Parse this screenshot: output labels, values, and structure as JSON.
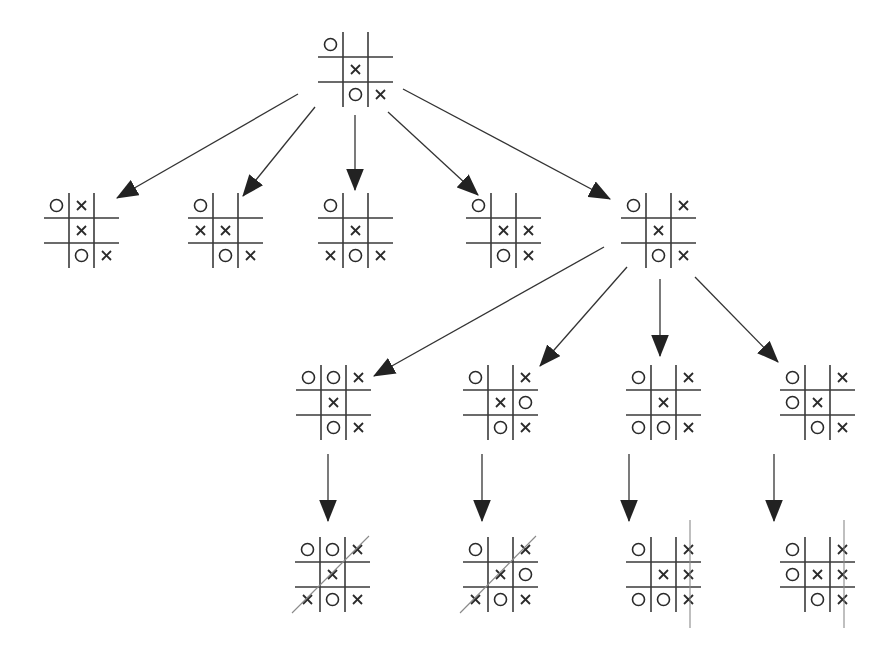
{
  "diagram": {
    "type": "game-tree",
    "colors": {
      "line": "#333333",
      "mark": "#2a2a2a",
      "win_line": "#8a8a8a",
      "background": "#ffffff"
    },
    "cell_size": 25,
    "nodes": [
      {
        "id": "root",
        "x": 318,
        "y": 32,
        "board": [
          "O",
          "",
          "",
          "",
          "X",
          "",
          "",
          "O",
          "X"
        ]
      },
      {
        "id": "L1-1",
        "x": 44,
        "y": 193,
        "board": [
          "O",
          "X",
          "",
          "",
          "X",
          "",
          "",
          "O",
          "X"
        ]
      },
      {
        "id": "L1-2",
        "x": 188,
        "y": 193,
        "board": [
          "O",
          "",
          "",
          "X",
          "X",
          "",
          "",
          "O",
          "X"
        ]
      },
      {
        "id": "L1-3",
        "x": 318,
        "y": 193,
        "board": [
          "O",
          "",
          "",
          "",
          "X",
          "",
          "X",
          "O",
          "X"
        ]
      },
      {
        "id": "L1-4",
        "x": 466,
        "y": 193,
        "board": [
          "O",
          "",
          "",
          "",
          "X",
          "X",
          "",
          "O",
          "X"
        ]
      },
      {
        "id": "L1-5",
        "x": 621,
        "y": 193,
        "board": [
          "O",
          "",
          "X",
          "",
          "X",
          "",
          "",
          "O",
          "X"
        ]
      },
      {
        "id": "L2-1",
        "x": 296,
        "y": 365,
        "board": [
          "O",
          "O",
          "X",
          "",
          "X",
          "",
          "",
          "O",
          "X"
        ]
      },
      {
        "id": "L2-2",
        "x": 463,
        "y": 365,
        "board": [
          "O",
          "",
          "X",
          "",
          "X",
          "O",
          "",
          "O",
          "X"
        ]
      },
      {
        "id": "L2-3",
        "x": 626,
        "y": 365,
        "board": [
          "O",
          "",
          "X",
          "",
          "X",
          "",
          "O",
          "O",
          "X"
        ]
      },
      {
        "id": "L2-4",
        "x": 780,
        "y": 365,
        "board": [
          "O",
          "",
          "X",
          "O",
          "X",
          "",
          "",
          "O",
          "X"
        ]
      },
      {
        "id": "L3-1",
        "x": 295,
        "y": 537,
        "board": [
          "O",
          "O",
          "X",
          "",
          "X",
          "",
          "X",
          "O",
          "X"
        ],
        "win": {
          "type": "anti-diagonal",
          "x1": 292,
          "y1": 613,
          "x2": 369,
          "y2": 536
        }
      },
      {
        "id": "L3-2",
        "x": 463,
        "y": 537,
        "board": [
          "O",
          "",
          "X",
          "",
          "X",
          "O",
          "X",
          "O",
          "X"
        ],
        "win": {
          "type": "anti-diagonal",
          "x1": 460,
          "y1": 613,
          "x2": 536,
          "y2": 536
        }
      },
      {
        "id": "L3-3",
        "x": 626,
        "y": 537,
        "board": [
          "O",
          "",
          "X",
          "",
          "X",
          "X",
          "O",
          "O",
          "X"
        ],
        "win": {
          "type": "column",
          "x1": 690,
          "y1": 520,
          "x2": 690,
          "y2": 628
        }
      },
      {
        "id": "L3-4",
        "x": 780,
        "y": 537,
        "board": [
          "O",
          "",
          "X",
          "O",
          "X",
          "X",
          "",
          "O",
          "X"
        ],
        "win": {
          "type": "column",
          "x1": 844,
          "y1": 520,
          "x2": 844,
          "y2": 628
        }
      }
    ],
    "edges": [
      {
        "from": "root",
        "to": "L1-1",
        "x1": 298,
        "y1": 94,
        "x2": 117,
        "y2": 198
      },
      {
        "from": "root",
        "to": "L1-2",
        "x1": 315,
        "y1": 107,
        "x2": 243,
        "y2": 196
      },
      {
        "from": "root",
        "to": "L1-3",
        "x1": 355,
        "y1": 115,
        "x2": 355,
        "y2": 190
      },
      {
        "from": "root",
        "to": "L1-4",
        "x1": 388,
        "y1": 112,
        "x2": 478,
        "y2": 195
      },
      {
        "from": "root",
        "to": "L1-5",
        "x1": 403,
        "y1": 89,
        "x2": 610,
        "y2": 199
      },
      {
        "from": "L1-5",
        "to": "L2-1",
        "x1": 604,
        "y1": 247,
        "x2": 374,
        "y2": 376
      },
      {
        "from": "L1-5",
        "to": "L2-2",
        "x1": 627,
        "y1": 267,
        "x2": 540,
        "y2": 366
      },
      {
        "from": "L1-5",
        "to": "L2-3",
        "x1": 660,
        "y1": 279,
        "x2": 660,
        "y2": 356
      },
      {
        "from": "L1-5",
        "to": "L2-4",
        "x1": 695,
        "y1": 277,
        "x2": 778,
        "y2": 362
      },
      {
        "from": "L2-1",
        "to": "L3-1",
        "x1": 328,
        "y1": 454,
        "x2": 328,
        "y2": 521
      },
      {
        "from": "L2-2",
        "to": "L3-2",
        "x1": 482,
        "y1": 454,
        "x2": 482,
        "y2": 521
      },
      {
        "from": "L2-3",
        "to": "L3-3",
        "x1": 629,
        "y1": 454,
        "x2": 629,
        "y2": 521
      },
      {
        "from": "L2-4",
        "to": "L3-4",
        "x1": 774,
        "y1": 454,
        "x2": 774,
        "y2": 521
      }
    ]
  }
}
